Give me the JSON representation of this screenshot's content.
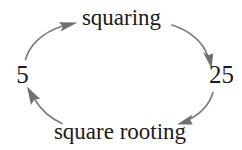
{
  "diagram": {
    "type": "cycle",
    "background_color": "#ffffff",
    "text_color": "#1b1b1b",
    "arrow_color": "#7d7d7d",
    "nodes": [
      {
        "id": "left",
        "label": "5",
        "position": "left"
      },
      {
        "id": "right",
        "label": "25",
        "position": "right"
      }
    ],
    "edges": [
      {
        "id": "forward",
        "label": "squaring",
        "from": "5",
        "to": "25",
        "position": "top",
        "direction": "clockwise"
      },
      {
        "id": "backward",
        "label": "square rooting",
        "from": "25",
        "to": "5",
        "position": "bottom",
        "direction": "clockwise"
      }
    ]
  }
}
